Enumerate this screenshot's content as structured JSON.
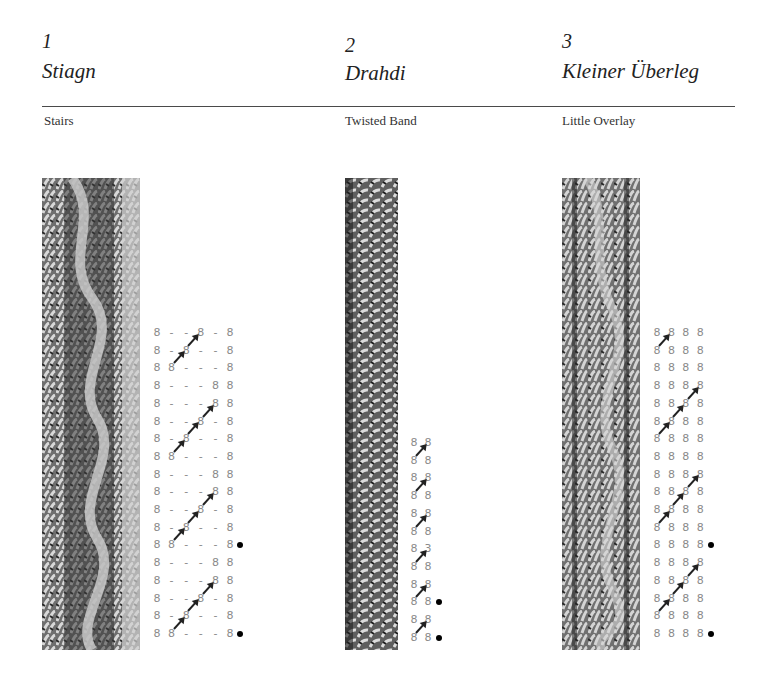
{
  "patterns": [
    {
      "number": "1",
      "title": "Stiagn",
      "subtitle": "Stairs",
      "chart": {
        "rows": [
          {
            "cells": [
              "8",
              "-",
              "-",
              "8",
              "-",
              "8"
            ],
            "dot": false
          },
          {
            "cells": [
              "8",
              "-",
              "8",
              "-",
              "-",
              "8"
            ],
            "dot": false
          },
          {
            "cells": [
              "8",
              "8",
              "-",
              "-",
              "-",
              "8"
            ],
            "dot": false
          },
          {
            "cells": [
              "8",
              "-",
              "-",
              "-",
              "8",
              "8"
            ],
            "dot": false
          },
          {
            "cells": [
              "8",
              "-",
              "-",
              "-",
              "8",
              "8"
            ],
            "dot": false
          },
          {
            "cells": [
              "8",
              "-",
              "-",
              "8",
              "-",
              "8"
            ],
            "dot": false
          },
          {
            "cells": [
              "8",
              "-",
              "8",
              "-",
              "-",
              "8"
            ],
            "dot": false
          },
          {
            "cells": [
              "8",
              "8",
              "-",
              "-",
              "-",
              "8"
            ],
            "dot": false
          },
          {
            "cells": [
              "8",
              "-",
              "-",
              "-",
              "8",
              "8"
            ],
            "dot": false
          },
          {
            "cells": [
              "8",
              "-",
              "-",
              "-",
              "8",
              "8"
            ],
            "dot": false
          },
          {
            "cells": [
              "8",
              "-",
              "-",
              "8",
              "-",
              "8"
            ],
            "dot": false
          },
          {
            "cells": [
              "8",
              "-",
              "8",
              "-",
              "-",
              "8"
            ],
            "dot": false
          },
          {
            "cells": [
              "8",
              "8",
              "-",
              "-",
              "-",
              "8"
            ],
            "dot": true
          },
          {
            "cells": [
              "8",
              "-",
              "-",
              "-",
              "8",
              "8"
            ],
            "dot": false
          },
          {
            "cells": [
              "8",
              "-",
              "-",
              "-",
              "8",
              "8"
            ],
            "dot": false
          },
          {
            "cells": [
              "8",
              "-",
              "-",
              "8",
              "-",
              "8"
            ],
            "dot": false
          },
          {
            "cells": [
              "8",
              "-",
              "8",
              "-",
              "-",
              "8"
            ],
            "dot": false
          },
          {
            "cells": [
              "8",
              "8",
              "-",
              "-",
              "-",
              "8"
            ],
            "dot": true
          }
        ],
        "arrows": [
          {
            "from_row": 1,
            "from_col": 2
          },
          {
            "from_row": 2,
            "from_col": 1
          },
          {
            "from_row": 5,
            "from_col": 3
          },
          {
            "from_row": 6,
            "from_col": 2
          },
          {
            "from_row": 7,
            "from_col": 1
          },
          {
            "from_row": 10,
            "from_col": 3
          },
          {
            "from_row": 11,
            "from_col": 2
          },
          {
            "from_row": 12,
            "from_col": 1
          },
          {
            "from_row": 15,
            "from_col": 3
          },
          {
            "from_row": 16,
            "from_col": 2
          },
          {
            "from_row": 17,
            "from_col": 1
          }
        ]
      }
    },
    {
      "number": "2",
      "title": "Drahdi",
      "subtitle": "Twisted Band",
      "chart": {
        "rows": [
          {
            "cells": [
              "8",
              "8"
            ],
            "dot": false
          },
          {
            "cells": [
              "8",
              "8"
            ],
            "dot": false
          },
          {
            "cells": [
              "8",
              "8"
            ],
            "dot": false
          },
          {
            "cells": [
              "8",
              "8"
            ],
            "dot": false
          },
          {
            "cells": [
              "8",
              "8"
            ],
            "dot": false
          },
          {
            "cells": [
              "8",
              "8"
            ],
            "dot": false
          },
          {
            "cells": [
              "8",
              "3"
            ],
            "dot": false
          },
          {
            "cells": [
              "8",
              "8"
            ],
            "dot": false
          },
          {
            "cells": [
              "8",
              "8"
            ],
            "dot": false
          },
          {
            "cells": [
              "8",
              "8"
            ],
            "dot": true
          },
          {
            "cells": [
              "8",
              "8"
            ],
            "dot": false
          },
          {
            "cells": [
              "8",
              "8"
            ],
            "dot": true
          }
        ],
        "arrows": [
          {
            "from_row": 1,
            "from_col": 0
          },
          {
            "from_row": 3,
            "from_col": 0
          },
          {
            "from_row": 5,
            "from_col": 0
          },
          {
            "from_row": 7,
            "from_col": 0
          },
          {
            "from_row": 9,
            "from_col": 0
          },
          {
            "from_row": 11,
            "from_col": 0
          }
        ]
      }
    },
    {
      "number": "3",
      "title": "Kleiner Überleg",
      "subtitle": "Little Overlay",
      "chart": {
        "rows": [
          {
            "cells": [
              "8",
              "8",
              "8",
              "8"
            ],
            "dot": false
          },
          {
            "cells": [
              "8",
              "8",
              "8",
              "8"
            ],
            "dot": false
          },
          {
            "cells": [
              "8",
              "8",
              "8",
              "8"
            ],
            "dot": false
          },
          {
            "cells": [
              "8",
              "8",
              "8",
              "8"
            ],
            "dot": false
          },
          {
            "cells": [
              "8",
              "8",
              "8",
              "8"
            ],
            "dot": false
          },
          {
            "cells": [
              "8",
              "8",
              "8",
              "8"
            ],
            "dot": false
          },
          {
            "cells": [
              "8",
              "8",
              "8",
              "8"
            ],
            "dot": false
          },
          {
            "cells": [
              "8",
              "8",
              "8",
              "8"
            ],
            "dot": false
          },
          {
            "cells": [
              "8",
              "8",
              "8",
              "8"
            ],
            "dot": false
          },
          {
            "cells": [
              "8",
              "8",
              "8",
              "8"
            ],
            "dot": false
          },
          {
            "cells": [
              "8",
              "8",
              "8",
              "8"
            ],
            "dot": false
          },
          {
            "cells": [
              "8",
              "8",
              "8",
              "8"
            ],
            "dot": false
          },
          {
            "cells": [
              "8",
              "8",
              "8",
              "8"
            ],
            "dot": true
          },
          {
            "cells": [
              "8",
              "8",
              "8",
              "8"
            ],
            "dot": false
          },
          {
            "cells": [
              "8",
              "8",
              "8",
              "8"
            ],
            "dot": false
          },
          {
            "cells": [
              "8",
              "8",
              "8",
              "8"
            ],
            "dot": false
          },
          {
            "cells": [
              "8",
              "8",
              "8",
              "8"
            ],
            "dot": false
          },
          {
            "cells": [
              "8",
              "8",
              "8",
              "8"
            ],
            "dot": true
          }
        ],
        "arrows": [
          {
            "from_row": 1,
            "from_col": 0
          },
          {
            "from_row": 4,
            "from_col": 2
          },
          {
            "from_row": 5,
            "from_col": 1
          },
          {
            "from_row": 6,
            "from_col": 0
          },
          {
            "from_row": 9,
            "from_col": 2
          },
          {
            "from_row": 10,
            "from_col": 1
          },
          {
            "from_row": 11,
            "from_col": 0
          },
          {
            "from_row": 14,
            "from_col": 2
          },
          {
            "from_row": 15,
            "from_col": 1
          },
          {
            "from_row": 16,
            "from_col": 0
          }
        ]
      }
    }
  ]
}
